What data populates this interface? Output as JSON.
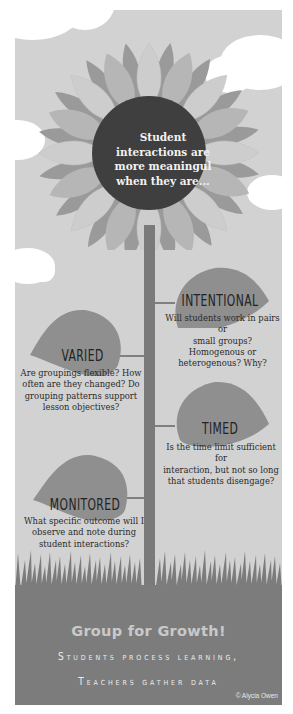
{
  "colors": {
    "background_panel": "#d2d2d2",
    "petal_light": "#cfcfcf",
    "petal_mid": "#b4b4b4",
    "petal_dark": "#9a9a9a",
    "center_circle": "#3f3f3f",
    "leaf": "#8f8f8f",
    "stem": "#7a7a7a",
    "grass": "#7c7c7c",
    "cloud": "#ffffff"
  },
  "flower": {
    "center_text_lines": [
      "Student",
      "interactions are",
      "more meaningul",
      "when they are..."
    ]
  },
  "leaves": [
    {
      "id": "intentional",
      "title": "INTENTIONAL",
      "text_lines": [
        "Will students work in pairs or",
        "small groups? Homogenous or",
        "heterogenous? Why?"
      ]
    },
    {
      "id": "varied",
      "title": "VARIED",
      "text_lines": [
        "Are groupings flexible? How",
        "often are they changed? Do",
        "grouping patterns support",
        "lesson objectives?"
      ]
    },
    {
      "id": "timed",
      "title": "TIMED",
      "text_lines": [
        "Is the time limit sufficient for",
        "interaction, but not so long",
        "that students disengage?"
      ]
    },
    {
      "id": "monitored",
      "title": "MONITORED",
      "text_lines": [
        "What specific outcome will I",
        "observe and note during",
        "student interactions?"
      ]
    }
  ],
  "footer": {
    "title": "Group for Growth!",
    "subtitle_line1": "Students process learning,",
    "subtitle_line2": "Teachers gather data",
    "credit": "© Alycia Owen"
  }
}
